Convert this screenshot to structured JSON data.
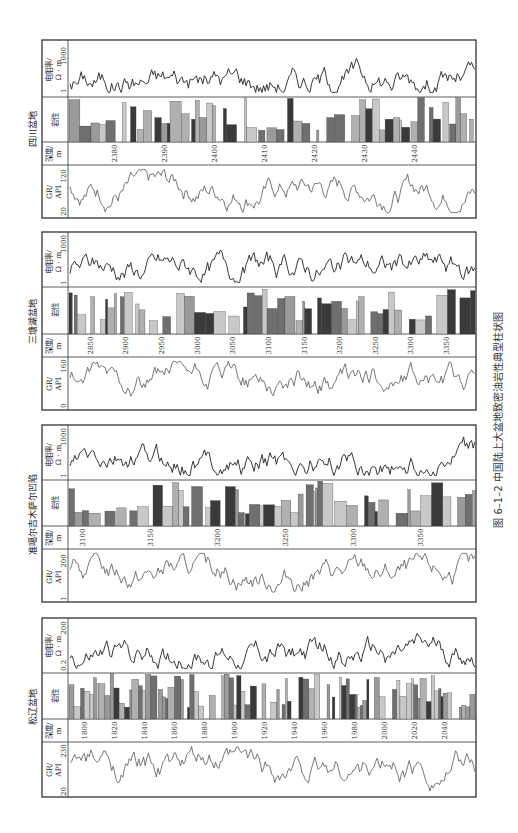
{
  "figure": {
    "caption": "图 6–1–2   中国陆上大盆地致密油岩性典型柱状图"
  },
  "track_labels": {
    "resistivity": "电阻率/",
    "resistivity_unit": "Ω · m",
    "lithology": "岩性",
    "depth": "深度/",
    "depth_unit": "m",
    "gr": "GR/",
    "gr_unit": "API"
  },
  "panels": [
    {
      "id": "sichuan",
      "title": "四川盆地",
      "res_min": "1",
      "res_max": "1000",
      "gr_min": "20",
      "gr_max": "120",
      "depth_ticks": [
        "2380",
        "2390",
        "2400",
        "2410",
        "2420",
        "2430",
        "2440"
      ],
      "depth_range": [
        2371,
        2452
      ]
    },
    {
      "id": "santanghu",
      "title": "三塘湖盆地",
      "res_min": "1",
      "res_max": "1000",
      "gr_min": "0",
      "gr_max": "160",
      "depth_ticks": [
        "2850",
        "2900",
        "2950",
        "3000",
        "3050",
        "3100",
        "3150",
        "3200",
        "3250",
        "3300",
        "3350"
      ],
      "depth_range": [
        2820,
        3390
      ]
    },
    {
      "id": "junggar",
      "title": "准噶尔吉木萨尔凹陷",
      "res_min": "1",
      "res_max": "1000",
      "gr_min": "1",
      "gr_max": "200",
      "depth_ticks": [
        "3100",
        "3150",
        "3200",
        "3250",
        "3300",
        "3350"
      ],
      "depth_range": [
        3090,
        3390
      ]
    },
    {
      "id": "songliao",
      "title": "松辽盆地",
      "res_min": "0.2",
      "res_max": "200",
      "gr_min": "20",
      "gr_max": "230",
      "depth_ticks": [
        "1800",
        "1820",
        "1840",
        "1860",
        "1880",
        "1900",
        "1920",
        "1940",
        "1960",
        "1980",
        "2000",
        "2020",
        "2040"
      ],
      "depth_range": [
        1790,
        2060
      ]
    }
  ]
}
